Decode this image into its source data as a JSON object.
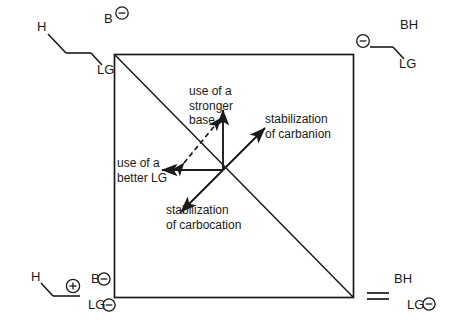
{
  "figure": {
    "kind": "more-oferrall-jencks-diagram",
    "background_color": "#ffffff",
    "line_color": "#1a1a1a"
  },
  "corners": {
    "top_left": {
      "name": "reactants",
      "base_label": "B",
      "base_charge": "⊖",
      "hydrogen_label": "H",
      "leaving_group_label": "LG"
    },
    "top_right": {
      "name": "carbanion-intermediate",
      "conjugate_acid_label": "BH",
      "carbanion_charge": "⊖",
      "leaving_group_label": "LG"
    },
    "bottom_left": {
      "name": "carbocation-intermediate",
      "hydrogen_label": "H",
      "carbocation_charge": "⊕",
      "base_label": "B",
      "base_charge": "⊖",
      "leaving_group_label": "LG",
      "leaving_group_charge": "⊖"
    },
    "bottom_right": {
      "name": "products",
      "conjugate_acid_label": "BH",
      "alkene_symbol": "=",
      "leaving_group_label": "LG",
      "leaving_group_charge": "⊖"
    }
  },
  "annotations": {
    "up": {
      "line1": "use of a",
      "line2": "stronger",
      "line3": "base"
    },
    "left": {
      "line1": "use of a",
      "line2": "better LG"
    },
    "upper_right": {
      "line1": "stabilization",
      "line2": "of carbanion"
    },
    "lower_left": {
      "line1": "stabilization",
      "line2": "of carbocation"
    }
  },
  "geometry": {
    "box": {
      "x": 114,
      "y": 54,
      "width": 239,
      "height": 243
    },
    "origin": {
      "x": 223,
      "y": 170
    },
    "vectors": [
      {
        "name": "stronger-base-arrow",
        "style": "solid",
        "heads": 1,
        "dx": 0,
        "dy": -62
      },
      {
        "name": "better-lg-arrow",
        "style": "solid",
        "heads": 1,
        "dx": -63,
        "dy": 0
      },
      {
        "name": "carbanion-stabilization-arrow",
        "style": "solid",
        "heads": 1,
        "dx": 44,
        "dy": -44
      },
      {
        "name": "carbocation-stabilization-arrow",
        "style": "solid",
        "heads": 1,
        "dx": -44,
        "dy": 44
      },
      {
        "name": "perpendicular-dashed-arrow",
        "style": "dashed",
        "heads": 2,
        "dx": 44,
        "dy": -44
      }
    ]
  }
}
